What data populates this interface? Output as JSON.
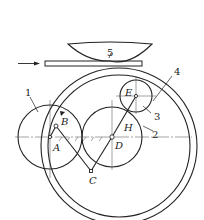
{
  "diagram": {
    "type": "mechanism-schematic",
    "colors": {
      "stroke": "#222222",
      "background": "#ffffff"
    },
    "part_labels": {
      "p1": "1",
      "p2": "2",
      "p3": "3",
      "p4": "4",
      "p5": "5"
    },
    "point_labels": {
      "A": "A",
      "B": "B",
      "C": "C",
      "D": "D",
      "E": "E",
      "H": "H"
    },
    "feed_direction": "arrow-right"
  }
}
